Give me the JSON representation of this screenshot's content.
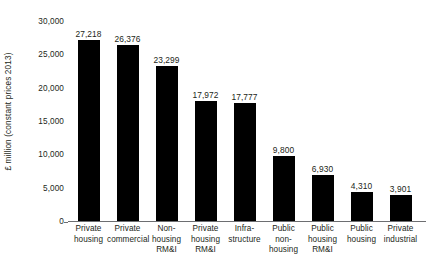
{
  "chart_data": {
    "type": "bar",
    "title": "",
    "xlabel": "",
    "ylabel": "£ million (constant prices 2013)",
    "ylim": [
      0,
      30000
    ],
    "ytick_values": [
      0,
      5000,
      10000,
      15000,
      20000,
      25000,
      30000
    ],
    "ytick_labels": [
      "0",
      "5,000",
      "10,000",
      "15,000",
      "20,000",
      "25,000",
      "30,000"
    ],
    "grid": false,
    "legend": false,
    "bar_color": "#000000",
    "categories": [
      "Private housing",
      "Private commercial",
      "Non-housing RM&I",
      "Private housing RM&I",
      "Infrastructure",
      "Public non-housing",
      "Public housing RM&I",
      "Public housing",
      "Private industrial"
    ],
    "category_lines": [
      [
        "Private",
        "housing"
      ],
      [
        "Private",
        "commercial"
      ],
      [
        "Non-",
        "housing",
        "RM&I"
      ],
      [
        "Private",
        "housing",
        "RM&I"
      ],
      [
        "Infra-",
        "structure"
      ],
      [
        "Public",
        "non-",
        "housing"
      ],
      [
        "Public",
        "housing",
        "RM&I"
      ],
      [
        "Public",
        "housing"
      ],
      [
        "Private",
        "industrial"
      ]
    ],
    "values": [
      27218,
      26376,
      23299,
      17972,
      17777,
      9800,
      6930,
      4310,
      3901
    ],
    "value_labels": [
      "27,218",
      "26,376",
      "23,299",
      "17,972",
      "17,777",
      "9,800",
      "6,930",
      "4,310",
      "3,901"
    ]
  }
}
